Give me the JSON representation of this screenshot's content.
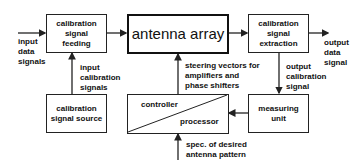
{
  "blocks": {
    "cal_feeding": "calibration\nsignal\nfeeding",
    "antenna_array": "antenna array",
    "cal_extraction": "calibration\nsignal\nextraction",
    "cal_source": "calibration\nsignal source",
    "controller": "controller",
    "processor": "processor",
    "measuring_unit": "measuring\nunit"
  },
  "labels": {
    "input_data": "input\ndata\nsignals",
    "output_data": "output\ndata\nsignal",
    "input_cal": "input\ncalibration\nsignals",
    "output_cal": "output\ncalibration\nsignal",
    "steering": "steering vectors for\namplifiers and\nphase shifters",
    "spec": "spec. of desired\nantenna pattern"
  },
  "colors": {
    "line": "#222222",
    "background": "#ffffff"
  }
}
